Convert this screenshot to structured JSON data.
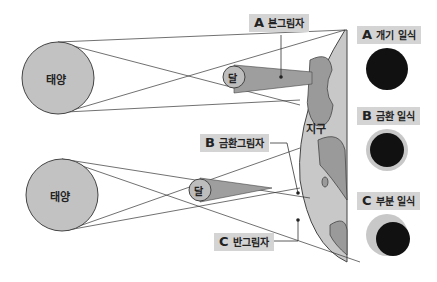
{
  "diagram": {
    "bodies": {
      "sun_top": "태양",
      "sun_bottom": "태양",
      "moon_top": "달",
      "moon_bottom": "달",
      "earth": "지구"
    },
    "shadow_labels": {
      "umbra": {
        "letter": "A",
        "text": "본그림자"
      },
      "antumbra": {
        "letter": "B",
        "text": "금환그림자"
      },
      "penumbra": {
        "letter": "C",
        "text": "반그림자"
      }
    },
    "eclipse_types": [
      {
        "letter": "A",
        "text": "개기 일식"
      },
      {
        "letter": "B",
        "text": "금환 일식"
      },
      {
        "letter": "C",
        "text": "부분 일식"
      }
    ],
    "colors": {
      "sun": "#c2c2c2",
      "earth_sea": "#c8c8c8",
      "earth_land": "#9a9a9a",
      "shadow": "#9e9e9e",
      "label_bg": "#d4d4d4",
      "eclipse_dark": "#111111"
    }
  }
}
